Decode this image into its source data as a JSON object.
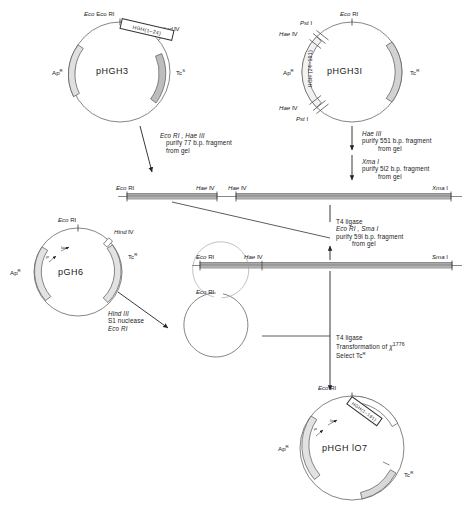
{
  "figure": {
    "type": "cloning-scheme"
  },
  "plasmids": [
    {
      "id": "phgh3",
      "name": "pHGH3",
      "insert": "HGH(1–24)",
      "markers": [
        "Ap",
        "Tc"
      ],
      "ap_label": "Ap",
      "ap_sup": "R",
      "tc_label": "Tc",
      "tc_sup": "S",
      "sites": [
        "Eco RI",
        "Hind III"
      ]
    },
    {
      "id": "phgh3i",
      "name": "pHGH3I",
      "insert": "HGH (24–191)",
      "ap_label": "Ap",
      "ap_sup": "R",
      "tc_label": "Tc",
      "tc_sup": "R",
      "sites": [
        "Eco RI",
        "Pst I",
        "Hae III",
        "Hae III",
        "Pst I"
      ]
    },
    {
      "id": "pgh6",
      "name": "pGH6",
      "ap_label": "Ap",
      "ap_sup": "R",
      "tc_label": "Tc",
      "tc_sup": "R",
      "sites": [
        "Eco RI",
        "Hind III"
      ],
      "promoter_labels": [
        "P",
        "lac"
      ]
    },
    {
      "id": "phgh107",
      "name": "pHGH lO7",
      "insert": "HGH(1–191)",
      "ap_label": "Ap",
      "ap_sup": "R",
      "tc_label": "Tc",
      "tc_sup": "R",
      "sites": [
        "Eco RI"
      ],
      "promoter_labels": [
        "P",
        "lac"
      ]
    }
  ],
  "steps": {
    "left_digest": {
      "enzymes": "Eco RI , Hae III",
      "line2": "purify 77 b.p. fragment",
      "line3": "from gel"
    },
    "right_digest_1": {
      "enzymes": "Hae III",
      "line2": "purify 551 b.p. fragment",
      "line3": "from gel"
    },
    "right_digest_2": {
      "enzymes": "Xma I",
      "line2": "purify 5l2 b.p. fragment",
      "line3": "from gel"
    },
    "ligase_1": {
      "line1": "T4 ligase",
      "enzymes": "Eco RI , Sma I",
      "line3": "purify 59l b.p. fragment",
      "line4": "from gel"
    },
    "nuclease": {
      "line1": "Hind III",
      "line2": "S1 nuclease",
      "line3": "Eco RI"
    },
    "ligase_2": {
      "line1": "T4 ligase",
      "line2_pre": "Transformation of ",
      "line2_chi": "χ",
      "line2_sup": "1776",
      "line3_pre": "Select Tc",
      "line3_sup": "R"
    }
  },
  "fragments": [
    {
      "id": "frag-77",
      "left_label": "Eco RI",
      "right_label": "Hae III"
    },
    {
      "id": "frag-512",
      "left_label": "Hae III",
      "right_label": "Xma I"
    },
    {
      "id": "frag-591",
      "left_label": "Eco RI",
      "mid_label": "Hae III",
      "right_label": "Sma I"
    }
  ],
  "open_circle": {
    "id": "linearized-pgh6",
    "site": "Eco RI"
  }
}
